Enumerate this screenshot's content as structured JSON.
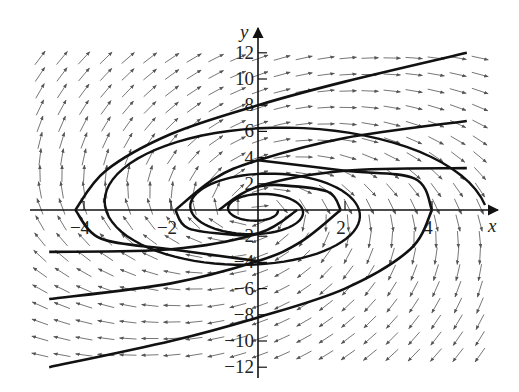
{
  "chart_data": {
    "type": "vector-field",
    "title": "",
    "xlabel": "x",
    "ylabel": "y",
    "x_ticks": [
      -4,
      -2,
      2,
      4
    ],
    "y_ticks": [
      -12,
      -10,
      -8,
      -6,
      -4,
      -2,
      2,
      4,
      6,
      8,
      10,
      12
    ],
    "x_tick_labels": [
      "−4",
      "−2",
      "2",
      "4"
    ],
    "y_tick_labels": [
      "−12",
      "−10",
      "−8",
      "−6",
      "−4",
      "−2",
      "2",
      "4",
      "6",
      "8",
      "10",
      "12"
    ],
    "xlim": [
      -5.3,
      5.3
    ],
    "ylim": [
      -13,
      13
    ],
    "grid": false,
    "field": {
      "dx": "0.15*x + 0.25*y",
      "dy": "-1.2*x + 0.3*y"
    },
    "trajectories": [
      {
        "name": "upper-outer",
        "approx_points": [
          [
            -4.2,
            0
          ],
          [
            -3.5,
            3
          ],
          [
            -2,
            5.8
          ],
          [
            0,
            8.0
          ],
          [
            2,
            9.8
          ],
          [
            4.8,
            12
          ]
        ]
      },
      {
        "name": "upper-mid",
        "approx_points": [
          [
            -1.9,
            0
          ],
          [
            -1.0,
            2.4
          ],
          [
            0,
            3.8
          ],
          [
            2,
            5.5
          ],
          [
            4.8,
            6.8
          ]
        ]
      },
      {
        "name": "upper-inner",
        "approx_points": [
          [
            -0.9,
            0
          ],
          [
            0,
            1.8
          ],
          [
            2,
            3.0
          ],
          [
            4.8,
            3.2
          ]
        ]
      },
      {
        "name": "lower-outer",
        "approx_points": [
          [
            4.0,
            0
          ],
          [
            3.5,
            -3
          ],
          [
            2,
            -6
          ],
          [
            0,
            -8.2
          ],
          [
            -2,
            -10
          ],
          [
            -4.8,
            -12
          ]
        ]
      },
      {
        "name": "lower-mid",
        "approx_points": [
          [
            1.9,
            0
          ],
          [
            1.0,
            -2.4
          ],
          [
            0,
            -3.9
          ],
          [
            -2,
            -5.6
          ],
          [
            -4.8,
            -6.8
          ]
        ]
      },
      {
        "name": "lower-inner",
        "approx_points": [
          [
            0.9,
            0
          ],
          [
            0,
            -1.8
          ],
          [
            -2,
            -3.0
          ],
          [
            -4.8,
            -3.2
          ]
        ]
      }
    ]
  },
  "axes": {
    "x_label": "x",
    "y_label": "y"
  }
}
